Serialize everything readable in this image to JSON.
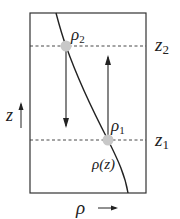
{
  "diagram": {
    "levels": [
      {
        "id": "z2",
        "label": "z",
        "sub": "2"
      },
      {
        "id": "z1",
        "label": "z",
        "sub": "1"
      }
    ],
    "points": [
      {
        "id": "rho2",
        "label": "ρ",
        "sub": "2"
      },
      {
        "id": "rho1",
        "label": "ρ",
        "sub": "1"
      }
    ],
    "curve_label": "ρ(z)",
    "y_axis": {
      "label": "z",
      "arrow": "↑"
    },
    "x_axis": {
      "label": "ρ",
      "arrow": "→"
    },
    "colors": {
      "line": "#222222",
      "dot": "#c8c8c8",
      "dash": "#333333"
    }
  }
}
